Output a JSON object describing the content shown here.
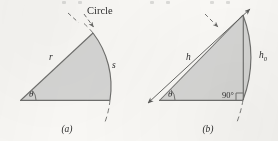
{
  "figure": {
    "kind": "textbook-line-figure",
    "background_color": "#faf9f6",
    "sector_fill_color": "#d6d6d4",
    "line_color": "#6f6f6d",
    "text_color": "#2e2e2e"
  },
  "panel_a": {
    "caption": "(a)",
    "labels": {
      "circle": "Circle",
      "radius": "r",
      "arc": "s",
      "angle": "θ"
    },
    "elements": {
      "leader_line": "dashed-leader-to-arc",
      "extension_lines": "dashed-circle-extension"
    }
  },
  "panel_b": {
    "caption": "(b)",
    "labels": {
      "chord": "h",
      "height": "h",
      "height_subscript": "0",
      "angle": "θ",
      "right_angle": "90",
      "degree_symbol": "°"
    },
    "elements": {
      "dimension_arrow": "double-headed-arrow",
      "leader_line": "dashed-leader-to-arc",
      "right_angle_mark": "square-corner",
      "extension_lines": "dashed-circle-extension"
    }
  }
}
